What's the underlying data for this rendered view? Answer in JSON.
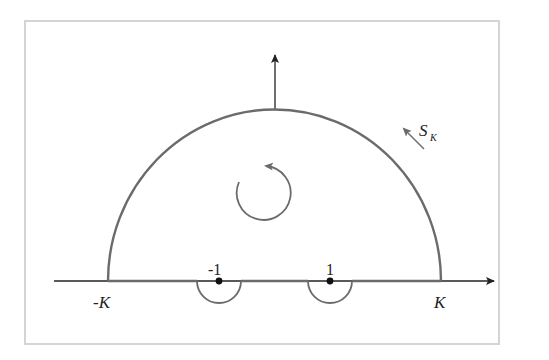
{
  "diagram": {
    "type": "contour-integration",
    "labels": {
      "neg_k": "-K",
      "pos_k": "K",
      "neg_one": "-1",
      "pos_one": "1",
      "contour_main": "S",
      "contour_sub": "K"
    },
    "colors": {
      "contour": "#6b6b6b",
      "axis": "#222222",
      "frame": "#d4d4d4",
      "point": "#111111"
    },
    "elements": [
      "real-axis-arrow",
      "imaginary-axis-arrow",
      "large-semicircle-arc",
      "indent-at-minus-one",
      "indent-at-plus-one",
      "counterclockwise-orientation-arrow",
      "contour-label-S_K"
    ]
  }
}
